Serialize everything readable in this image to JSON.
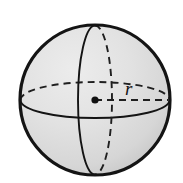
{
  "figure": {
    "name": "sphere-with-radius",
    "caption": "",
    "background_color": "#ffffff"
  },
  "labels": {
    "radius": "r"
  },
  "geometry": {
    "center_x": 95,
    "center_y": 100,
    "radius": 75,
    "equator_ry": 18,
    "meridian_rx": 17,
    "radius_line_end_x": 168,
    "center_dot_radius": 3.6
  },
  "colors": {
    "outline": "#141414",
    "fill_light": "#e6e6e6",
    "fill_mid": "#d2d2d2",
    "fill_dark": "#bdbdbd",
    "dash": "#1f1f1f",
    "label": "#141414",
    "background": "#ffffff"
  },
  "strokes": {
    "outline_width": 3.2,
    "solid_width": 1.9,
    "dash_width": 1.9,
    "dash_pattern": "7 5",
    "radius_dash_pattern": "7 5"
  },
  "elements": [
    {
      "id": "sphere-outline",
      "kind": "circle",
      "style": "solid",
      "description": "sphere silhouette"
    },
    {
      "id": "meridian-front",
      "kind": "half-ellipse",
      "style": "solid",
      "description": "vertical great circle, near half"
    },
    {
      "id": "meridian-back",
      "kind": "half-ellipse",
      "style": "dashed",
      "description": "vertical great circle, far half"
    },
    {
      "id": "equator-front",
      "kind": "half-ellipse",
      "style": "solid",
      "description": "horizontal great circle, near half"
    },
    {
      "id": "equator-back",
      "kind": "half-ellipse",
      "style": "dashed",
      "description": "horizontal great circle, far half"
    },
    {
      "id": "radius-line",
      "kind": "segment",
      "style": "dashed",
      "description": "radius from center to surface"
    },
    {
      "id": "center-dot",
      "kind": "dot",
      "style": "filled",
      "description": "sphere center point"
    },
    {
      "id": "radius-label",
      "kind": "text",
      "style": "italic",
      "description": "letter r labeling the radius"
    }
  ]
}
